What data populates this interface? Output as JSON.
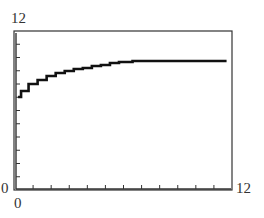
{
  "chart_data": {
    "type": "line",
    "title": "",
    "xlabel": "",
    "ylabel": "",
    "xlim": [
      0,
      12
    ],
    "ylim": [
      0,
      12
    ],
    "x_tick_step": 1,
    "y_tick_step": 1,
    "grid": false,
    "legend": null,
    "tick_labels": {
      "x_min": "0",
      "x_max": "12",
      "y_min": "0",
      "y_max": "12"
    },
    "series": [
      {
        "name": "curve",
        "style": "stepped calculator-style line",
        "color": "#111111",
        "x": [
          0.17,
          0.5,
          1,
          1.5,
          2,
          2.5,
          3,
          3.5,
          4,
          4.5,
          5,
          5.5,
          6,
          7,
          8,
          9,
          10,
          11,
          11.7
        ],
        "y": [
          7.0,
          7.5,
          8.0,
          8.3,
          8.6,
          8.8,
          8.95,
          9.1,
          9.2,
          9.35,
          9.45,
          9.55,
          9.66,
          9.7,
          9.7,
          9.7,
          9.7,
          9.7,
          9.7
        ]
      }
    ]
  },
  "labels": {
    "y_max": "12",
    "y_min": "0",
    "x_min": "0",
    "x_max": "12"
  },
  "frame": {
    "left_px": 15,
    "right_px": 232,
    "top_px": 31,
    "bottom_px": 190,
    "axis_color": "#333333",
    "curve_color": "#111111"
  }
}
